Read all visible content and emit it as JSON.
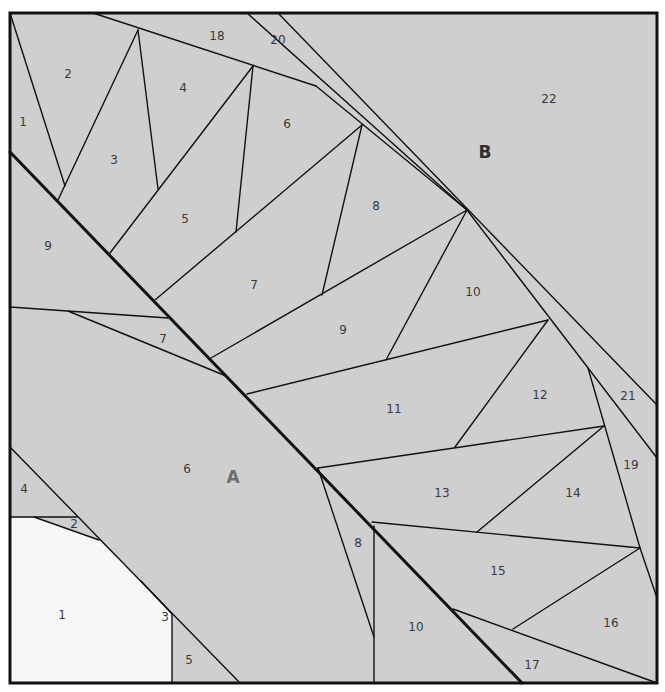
{
  "diagram": {
    "colors": {
      "fill_gray": "#cfcfcf",
      "fill_light": "#f7f7f7",
      "stroke": "#111111",
      "label_text": "#3a3a3a",
      "section_label_A": "#6e6e6e",
      "section_label_B": "#2e2e2e"
    },
    "frame": {
      "x1": 10,
      "y1": 13,
      "x2": 657,
      "y2": 683,
      "stroke_width": 3
    },
    "fills": [
      {
        "name": "light-piece-A1",
        "color": "#f7f7f7",
        "points": "10,517 34,517 99,540 141,581 172,614 172,683 10,683"
      }
    ],
    "seam_thick": [
      {
        "x1": 10,
        "y1": 152,
        "x2": 522,
        "y2": 683
      }
    ],
    "lines": [
      {
        "x1": 10,
        "y1": 13,
        "x2": 65,
        "y2": 186
      },
      {
        "x1": 58,
        "y1": 200,
        "x2": 138,
        "y2": 30
      },
      {
        "x1": 138,
        "y1": 30,
        "x2": 158,
        "y2": 189
      },
      {
        "x1": 93,
        "y1": 13,
        "x2": 316,
        "y2": 86
      },
      {
        "x1": 316,
        "y1": 86,
        "x2": 467,
        "y2": 210
      },
      {
        "x1": 247,
        "y1": 13,
        "x2": 467,
        "y2": 210
      },
      {
        "x1": 278,
        "y1": 13,
        "x2": 657,
        "y2": 405
      },
      {
        "x1": 110,
        "y1": 253,
        "x2": 253,
        "y2": 66
      },
      {
        "x1": 253,
        "y1": 66,
        "x2": 236,
        "y2": 232
      },
      {
        "x1": 155,
        "y1": 300,
        "x2": 362,
        "y2": 125
      },
      {
        "x1": 362,
        "y1": 125,
        "x2": 322,
        "y2": 295
      },
      {
        "x1": 211,
        "y1": 358,
        "x2": 467,
        "y2": 210
      },
      {
        "x1": 467,
        "y1": 210,
        "x2": 386,
        "y2": 360
      },
      {
        "x1": 467,
        "y1": 210,
        "x2": 657,
        "y2": 458
      },
      {
        "x1": 247,
        "y1": 394,
        "x2": 548,
        "y2": 320
      },
      {
        "x1": 548,
        "y1": 320,
        "x2": 455,
        "y2": 447
      },
      {
        "x1": 588,
        "y1": 368,
        "x2": 640,
        "y2": 548
      },
      {
        "x1": 640,
        "y1": 548,
        "x2": 657,
        "y2": 598
      },
      {
        "x1": 318,
        "y1": 468,
        "x2": 604,
        "y2": 426
      },
      {
        "x1": 604,
        "y1": 426,
        "x2": 477,
        "y2": 532
      },
      {
        "x1": 318,
        "y1": 468,
        "x2": 374,
        "y2": 637
      },
      {
        "x1": 372,
        "y1": 522,
        "x2": 640,
        "y2": 548
      },
      {
        "x1": 374,
        "y1": 526,
        "x2": 374,
        "y2": 683
      },
      {
        "x1": 640,
        "y1": 548,
        "x2": 513,
        "y2": 629
      },
      {
        "x1": 453,
        "y1": 609,
        "x2": 657,
        "y2": 683
      },
      {
        "x1": 10,
        "y1": 307,
        "x2": 168,
        "y2": 318
      },
      {
        "x1": 68,
        "y1": 311,
        "x2": 226,
        "y2": 376
      },
      {
        "x1": 10,
        "y1": 447,
        "x2": 240,
        "y2": 683
      },
      {
        "x1": 10,
        "y1": 517,
        "x2": 77,
        "y2": 517
      },
      {
        "x1": 34,
        "y1": 517,
        "x2": 99,
        "y2": 540
      },
      {
        "x1": 141,
        "y1": 581,
        "x2": 172,
        "y2": 614
      },
      {
        "x1": 172,
        "y1": 614,
        "x2": 172,
        "y2": 683
      }
    ],
    "pieces": [
      {
        "label": "1",
        "x": 23,
        "y": 122,
        "section": "B"
      },
      {
        "label": "2",
        "x": 68,
        "y": 74,
        "section": "B"
      },
      {
        "label": "3",
        "x": 114,
        "y": 160,
        "section": "B"
      },
      {
        "label": "4",
        "x": 183,
        "y": 88,
        "section": "B"
      },
      {
        "label": "5",
        "x": 185,
        "y": 219,
        "section": "B"
      },
      {
        "label": "6",
        "x": 287,
        "y": 124,
        "section": "B"
      },
      {
        "label": "7",
        "x": 254,
        "y": 285,
        "section": "B"
      },
      {
        "label": "8",
        "x": 376,
        "y": 206,
        "section": "B"
      },
      {
        "label": "9",
        "x": 343,
        "y": 330,
        "section": "B"
      },
      {
        "label": "10",
        "x": 473,
        "y": 292,
        "section": "B"
      },
      {
        "label": "11",
        "x": 394,
        "y": 409,
        "section": "B"
      },
      {
        "label": "12",
        "x": 540,
        "y": 395,
        "section": "B"
      },
      {
        "label": "13",
        "x": 442,
        "y": 493,
        "section": "B"
      },
      {
        "label": "14",
        "x": 573,
        "y": 493,
        "section": "B"
      },
      {
        "label": "15",
        "x": 498,
        "y": 571,
        "section": "B"
      },
      {
        "label": "16",
        "x": 611,
        "y": 623,
        "section": "B"
      },
      {
        "label": "17",
        "x": 532,
        "y": 665,
        "section": "B"
      },
      {
        "label": "18",
        "x": 217,
        "y": 36,
        "section": "B"
      },
      {
        "label": "19",
        "x": 631,
        "y": 465,
        "section": "B"
      },
      {
        "label": "20",
        "x": 278,
        "y": 40,
        "section": "B"
      },
      {
        "label": "21",
        "x": 628,
        "y": 396,
        "section": "B"
      },
      {
        "label": "22",
        "x": 549,
        "y": 99,
        "section": "B"
      },
      {
        "label": "9",
        "x": 48,
        "y": 246,
        "section": "A"
      },
      {
        "label": "7",
        "x": 163,
        "y": 339,
        "section": "A"
      },
      {
        "label": "6",
        "x": 187,
        "y": 469,
        "section": "A"
      },
      {
        "label": "4",
        "x": 24,
        "y": 489,
        "section": "A"
      },
      {
        "label": "2",
        "x": 74,
        "y": 524,
        "section": "A"
      },
      {
        "label": "1",
        "x": 62,
        "y": 615,
        "section": "A"
      },
      {
        "label": "3",
        "x": 165,
        "y": 617,
        "section": "A"
      },
      {
        "label": "5",
        "x": 189,
        "y": 660,
        "section": "A"
      },
      {
        "label": "8",
        "x": 358,
        "y": 543,
        "section": "A"
      },
      {
        "label": "10",
        "x": 416,
        "y": 627,
        "section": "A"
      }
    ],
    "sections": [
      {
        "label": "A",
        "x": 233,
        "y": 478
      },
      {
        "label": "B",
        "x": 485,
        "y": 153
      }
    ]
  }
}
